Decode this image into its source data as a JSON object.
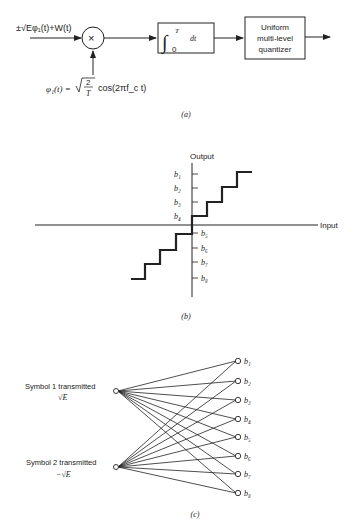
{
  "panel_a": {
    "caption": "(a)",
    "input_signal": "±√Eφ₁(t)+W(t)",
    "multiplier_symbol": "×",
    "reference_signal_lhs": "φ₁(t) =",
    "reference_signal_sqrt": "2/T",
    "reference_signal_num": "2",
    "reference_signal_den": "T",
    "reference_signal_rhs": "cos(2πf_c t)",
    "integrator_upper": "T",
    "integrator_lower": "0",
    "integrator_dt": "dt",
    "quantizer_lines": [
      "Uniform",
      "multi-level",
      "quantizer"
    ]
  },
  "panel_b": {
    "caption": "(b)",
    "y_axis_label": "Output",
    "x_axis_label": "Input",
    "levels_above": [
      "b₁",
      "b₂",
      "b₃",
      "b₄"
    ],
    "levels_below": [
      "b₅",
      "b₆",
      "b₇",
      "b₈"
    ]
  },
  "panel_c": {
    "caption": "(c)",
    "symbol1_label": "Symbol 1 transmitted",
    "symbol1_value": "√E",
    "symbol2_label": "Symbol 2 transmitted",
    "symbol2_value": "−√E",
    "outputs": [
      "b₁",
      "b₂",
      "b₃",
      "b₄",
      "b₅",
      "b₆",
      "b₇",
      "b₈"
    ]
  }
}
